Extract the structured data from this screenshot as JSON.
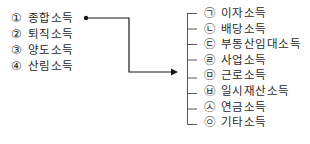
{
  "left": {
    "items": [
      {
        "marker": "①",
        "label": "종합소득"
      },
      {
        "marker": "②",
        "label": "퇴직소득"
      },
      {
        "marker": "③",
        "label": "양도소득"
      },
      {
        "marker": "④",
        "label": "산림소득"
      }
    ]
  },
  "right": {
    "items": [
      {
        "marker": "㉠",
        "label": "이자소득"
      },
      {
        "marker": "㉡",
        "label": "배당소득"
      },
      {
        "marker": "㉢",
        "label": "부동산임대소득"
      },
      {
        "marker": "㉣",
        "label": "사업소득"
      },
      {
        "marker": "㉤",
        "label": "근로소득"
      },
      {
        "marker": "㉥",
        "label": "일시재산소득"
      },
      {
        "marker": "㉦",
        "label": "연금소득"
      },
      {
        "marker": "㉧",
        "label": "기타소득"
      }
    ]
  },
  "connector": {
    "from": "종합소득",
    "to": "right-bracket",
    "color": "#1a1a1a"
  }
}
